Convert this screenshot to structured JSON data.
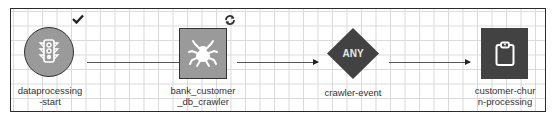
{
  "workflow": {
    "nodes": [
      {
        "id": "dataprocessing-start",
        "type": "start-trigger",
        "shape": "circle",
        "icon": "traffic-light-icon",
        "status_icon": "checkmark-icon",
        "label_line1": "dataprocessing",
        "label_line2": "-start",
        "fill": "#9a9a9a"
      },
      {
        "id": "bank_customer_db_crawler",
        "type": "crawler",
        "shape": "square",
        "icon": "spider-icon",
        "status_icon": "refresh-icon",
        "label_line1": "bank_customer",
        "label_line2": "_db_crawler",
        "fill": "#9a9a9a"
      },
      {
        "id": "crawler-event",
        "type": "event-condition",
        "shape": "diamond",
        "text": "ANY",
        "label_line1": "crawler-event",
        "fill": "#424242"
      },
      {
        "id": "customer-churn-processing",
        "type": "job",
        "shape": "square",
        "icon": "clipboard-icon",
        "label_line1": "customer-chur",
        "label_line2": "n-processing",
        "fill": "#424242"
      }
    ],
    "edges": [
      {
        "from": "dataprocessing-start",
        "to": "bank_customer_db_crawler"
      },
      {
        "from": "bank_customer_db_crawler",
        "to": "crawler-event"
      },
      {
        "from": "crawler-event",
        "to": "customer-churn-processing"
      }
    ]
  }
}
